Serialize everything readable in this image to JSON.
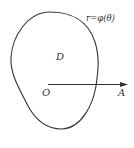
{
  "diagram": {
    "type": "polar-region",
    "curve_label": "r=φ(θ)",
    "region_label": "D",
    "origin_label": "O",
    "ray_end_label": "A",
    "colors": {
      "stroke": "#333333",
      "background": "#ffffff"
    }
  }
}
